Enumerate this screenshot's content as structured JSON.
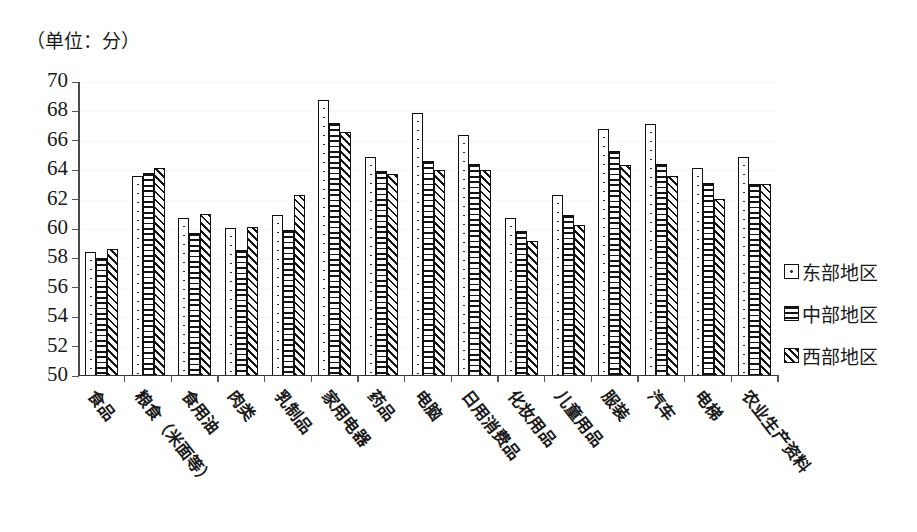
{
  "unit_label": "（单位：分）",
  "legend": {
    "position": "right",
    "items": [
      {
        "key": "east",
        "label": "东部地区",
        "pattern": "dotted"
      },
      {
        "key": "central",
        "label": "中部地区",
        "pattern": "horizontal-lines"
      },
      {
        "key": "west",
        "label": "西部地区",
        "pattern": "diagonal-hatch"
      }
    ]
  },
  "yaxis": {
    "ticks": [
      "70",
      "68",
      "66",
      "64",
      "62",
      "60",
      "58",
      "56",
      "54",
      "52",
      "50"
    ],
    "min": 50,
    "max": 70,
    "step": 2
  },
  "chart_data": {
    "type": "bar",
    "title": "",
    "subtitle": "",
    "xlabel": "",
    "ylabel": "（单位：分）",
    "ylim": [
      50,
      70
    ],
    "ytick_step": 2,
    "grid": true,
    "legend_position": "right",
    "categories": [
      "食品",
      "粮食（米面等）",
      "食用油",
      "肉类",
      "乳制品",
      "家用电器",
      "药品",
      "电脑",
      "日用消费品",
      "化妆用品",
      "儿童用品",
      "服装",
      "汽车",
      "电梯",
      "农业生产资料"
    ],
    "series": [
      {
        "name": "东部地区",
        "values": [
          58.4,
          63.6,
          60.7,
          60.0,
          60.9,
          68.8,
          64.9,
          67.9,
          66.4,
          60.7,
          62.3,
          66.8,
          67.1,
          64.1,
          64.9
        ]
      },
      {
        "name": "中部地区",
        "values": [
          58.0,
          63.8,
          59.7,
          58.5,
          59.9,
          67.2,
          63.9,
          64.6,
          64.4,
          59.8,
          60.9,
          65.3,
          64.4,
          63.1,
          63.0
        ]
      },
      {
        "name": "西部地区",
        "values": [
          58.6,
          64.15,
          61.0,
          60.1,
          62.3,
          66.6,
          63.7,
          64.0,
          64.0,
          59.1,
          60.2,
          64.3,
          63.6,
          62.0,
          63.0
        ]
      }
    ]
  }
}
